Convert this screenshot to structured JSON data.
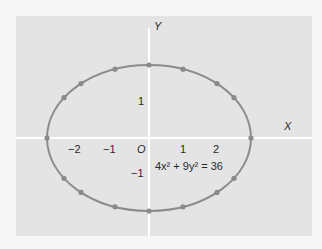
{
  "chart_data": {
    "type": "line",
    "title": "",
    "equation": "4x² + 9y² = 36",
    "xlabel": "X",
    "ylabel": "Y",
    "origin_label": "O",
    "x_ticks": [
      "−2",
      "−1",
      "1",
      "2"
    ],
    "y_ticks": [
      "1",
      "−1"
    ],
    "xlim": [
      -3.8,
      4.7
    ],
    "ylim": [
      -2.6,
      3.4
    ],
    "grid": false,
    "series": [
      {
        "name": "ellipse 4x^2 + 9y^2 = 36",
        "semi_axis_x": 3,
        "semi_axis_y": 2,
        "points": [
          [
            0,
            2
          ],
          [
            1,
            1.886
          ],
          [
            2,
            1.491
          ],
          [
            2.5,
            1.106
          ],
          [
            3,
            0
          ],
          [
            2.5,
            -1.106
          ],
          [
            2,
            -1.491
          ],
          [
            1,
            -1.886
          ],
          [
            0,
            -2
          ],
          [
            -1,
            -1.886
          ],
          [
            -2,
            -1.491
          ],
          [
            -2.5,
            -1.106
          ],
          [
            -3,
            0
          ],
          [
            -2.5,
            1.106
          ],
          [
            -2,
            1.491
          ],
          [
            -1,
            1.886
          ]
        ]
      }
    ],
    "colors": {
      "curve": "#8a8a8a",
      "points": "#8a8a8a",
      "axes": "#ffffff",
      "background": "#e4e4e4"
    }
  },
  "labels": {
    "x_axis": "X",
    "y_axis": "Y",
    "origin": "O",
    "tick_x_neg2": "−2",
    "tick_x_neg1": "−1",
    "tick_x_1": "1",
    "tick_x_2": "2",
    "tick_y_1": "1",
    "tick_y_neg1": "−1",
    "equation": "4x² + 9y² = 36"
  }
}
